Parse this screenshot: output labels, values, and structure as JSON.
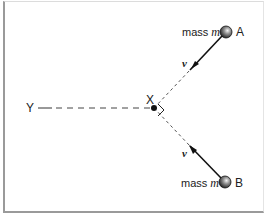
{
  "diagram": {
    "points": {
      "A": {
        "label": "A",
        "mass_text": "mass",
        "mass_symbol": "m"
      },
      "B": {
        "label": "B",
        "mass_text": "mass",
        "mass_symbol": "m"
      },
      "X": {
        "label": "X"
      },
      "Y": {
        "label": "Y"
      }
    },
    "velocity_A": "v",
    "velocity_B": "v",
    "right_angle_at": "X",
    "colors": {
      "line": "#222222",
      "border": "#9a9a9a",
      "ball": "#333333"
    }
  }
}
